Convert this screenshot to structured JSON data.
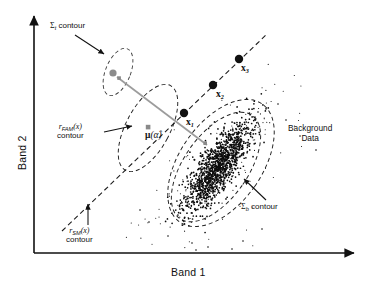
{
  "figure": {
    "type": "scatter-diagram"
  },
  "axes": {
    "x_label": "Band 1",
    "y_label": "Band 2",
    "x_arrow": "arrow-right",
    "y_arrow": "arrow-up",
    "origin": {
      "x": 34,
      "y": 253
    },
    "x_end": {
      "x": 356,
      "y": 253
    },
    "y_end": {
      "x": 34,
      "y": 14
    }
  },
  "annotations": {
    "sigma_t": {
      "symbol": "Σ",
      "subscript": "t",
      "text": " contour",
      "x": 50,
      "y": 26
    },
    "r_fam": {
      "symbol": "r",
      "subscript": "FAM",
      "arg": "(x)",
      "line2": "contour",
      "x": 60,
      "y": 124
    },
    "r_sm": {
      "symbol": "r",
      "subscript": "SM",
      "arg": "(x)",
      "line2": "contour",
      "x": 70,
      "y": 228
    },
    "sigma_b": {
      "symbol": "Σ",
      "subscript": "b",
      "text": " contour",
      "x": 240,
      "y": 205
    },
    "background_data": {
      "line1": "Background",
      "line2": "Data",
      "x": 289,
      "y": 126
    },
    "mu_alpha": {
      "symbol": "μ",
      "arg": "(α̂)",
      "x": 148,
      "y": 135
    }
  },
  "points": [
    {
      "label": "x",
      "subscript": "1",
      "cx": 184,
      "cy": 113,
      "label_x": 186,
      "label_y": 117,
      "r": 4.2
    },
    {
      "label": "x",
      "subscript": "2",
      "cx": 213,
      "cy": 85,
      "label_x": 216,
      "label_y": 89,
      "r": 4.2
    },
    {
      "label": "x",
      "subscript": "3",
      "cx": 239,
      "cy": 59,
      "label_x": 241,
      "label_y": 63,
      "r": 4.2
    }
  ],
  "markers": {
    "target_mean": {
      "cx": 113,
      "cy": 73,
      "r": 3.6,
      "kind": "gray-circle"
    },
    "target_sq": {
      "cx": 119,
      "cy": 78,
      "size": 3.4,
      "kind": "gray-square"
    },
    "mu_alpha_sq": {
      "cx": 148,
      "cy": 127,
      "size": 4.2,
      "kind": "gray-square"
    },
    "bg_sq": {
      "cx": 205,
      "cy": 143,
      "size": 3.4,
      "kind": "gray-square"
    }
  },
  "ellipses": {
    "sigma_t_contour": {
      "cx": 118,
      "cy": 72,
      "rx": 13,
      "ry": 26,
      "rotate": 22
    },
    "r_fam_contour": {
      "cx": 148,
      "cy": 128,
      "rx": 22,
      "ry": 48,
      "rotate": 28
    },
    "sigma_b_contour": {
      "cx": 218,
      "cy": 166,
      "rx": 33,
      "ry": 64,
      "rotate": 35
    },
    "sigma_b_outer": {
      "cx": 221,
      "cy": 163,
      "rx": 41,
      "ry": 72,
      "rotate": 35
    }
  },
  "lines": {
    "sm_dashed": {
      "x1": 62,
      "y1": 230,
      "x2": 266,
      "y2": 35
    },
    "gray_segment": {
      "x1": 117,
      "y1": 77,
      "x2": 207,
      "y2": 145
    }
  },
  "arrows": [
    {
      "name": "sigma-t-arrow",
      "x1": 76,
      "y1": 36,
      "x2": 105,
      "y2": 55
    },
    {
      "name": "r-fam-arrow",
      "x1": 106,
      "y1": 131,
      "x2": 134,
      "y2": 126
    },
    {
      "name": "r-sm-arrow",
      "x1": 88,
      "y1": 224,
      "x2": 88,
      "y2": 203
    },
    {
      "name": "sigma-b-arrow",
      "x1": 265,
      "y1": 199,
      "x2": 243,
      "y2": 178
    }
  ],
  "colors": {
    "ink": "#111111",
    "gray_marker": "#8c8c8c",
    "gray_line": "#9a9a9a",
    "dash": "#2b2b2b",
    "scatter": "#0d0d0d",
    "background": "#ffffff"
  },
  "chart_data": {
    "type": "scatter",
    "title": "",
    "xlabel": "Band 1",
    "ylabel": "Band 2",
    "grid": false,
    "legend": "none",
    "series": [
      {
        "name": "Background Data",
        "n_points": 1450,
        "shape": "elongated ellipsoidal cloud",
        "center": [
          218,
          166
        ],
        "orientation_deg": 55,
        "spread_major": 62,
        "spread_minor": 20
      },
      {
        "name": "Target abundance points",
        "values": [
          {
            "label": "x1",
            "x": 184,
            "y": 113
          },
          {
            "label": "x2",
            "x": 213,
            "y": 85
          },
          {
            "label": "x3",
            "x": 239,
            "y": 59
          }
        ]
      }
    ]
  }
}
